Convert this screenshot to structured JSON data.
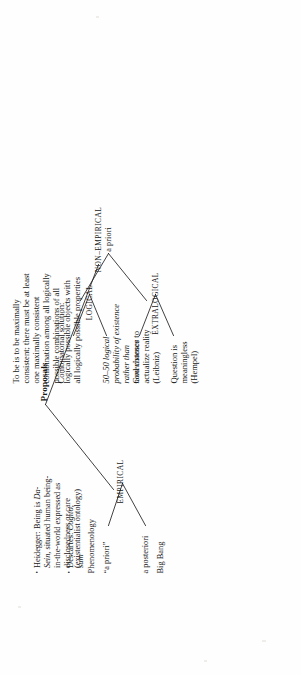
{
  "diagram": {
    "title": "Proposals",
    "type": "tree",
    "orientation": "rotated-90-ccw",
    "root": "Proposals",
    "branches": [
      {
        "id": "empirical",
        "label": "EMPIRICAL",
        "children": [
          {
            "id": "a-posteriori",
            "label": "a posteriori",
            "items": [
              "Big Bang"
            ]
          },
          {
            "id": "a-priori",
            "label": "“a priori”",
            "items": [
              "Phenomenology",
              "Descartes: Cogito, sum",
              "Heidegger: Being is Da-Sein, situated human being-in-the-world expressed as disclosedness or care (existentialist ontology)"
            ]
          }
        ]
      },
      {
        "id": "non-empirical",
        "label": "NON–EMPIRICAL",
        "sublabel": "a priori",
        "children": [
          {
            "id": "extralogical",
            "label": "EXTRALOGICAL",
            "items": [
              "Question is meaningless (Hempel)",
              "God chooses to actualize reality (Leibniz)"
            ]
          },
          {
            "id": "logical",
            "label": "LOGICAL",
            "items": [
              "50–50 logical probability of existence rather than nonexistence",
              "Combinatorial solution: To be is to be maximally consistent; there must be at least one maximally consistent combination among all logically possible combinations of all logically possible objects with all logically possible properties"
            ]
          }
        ]
      }
    ]
  },
  "labels": {
    "title": "Proposals",
    "empirical": "EMPIRICAL",
    "non_empirical": "NON–EMPIRICAL",
    "non_empirical_sub": "a priori",
    "a_posteriori": "a posteriori",
    "a_priori": "“a priori”",
    "extralogical": "EXTRALOGICAL",
    "logical": "LOGICAL",
    "big_bang": "Big Bang",
    "phenomenology": "Phenomenology",
    "descartes_pre": "Descartes: ",
    "descartes_it": "Cogito, sum",
    "heidegger_pre": "Heidegger: Being is ",
    "heidegger_it": "Da-Sein",
    "heidegger_post": ", situated human being-in-the-world expressed as disclosedness or care (existentialist ontology)",
    "hempel": "Question is meaningless (Hempel)",
    "leibniz": "God chooses to actualize reality (Leibniz)",
    "fifty_fifty": "50–50 logical probability of existence rather than nonexistence",
    "combinatorial_head": "Combinatorial solution:",
    "combinatorial_body": "To be is to be maximally consistent; there must be at least one maximally consistent combination among all logically possible combinations of all logically possible objects with all logically possible properties"
  },
  "colors": {
    "ink": "#171717",
    "paper": "#fefefe",
    "rule": "#202020"
  }
}
